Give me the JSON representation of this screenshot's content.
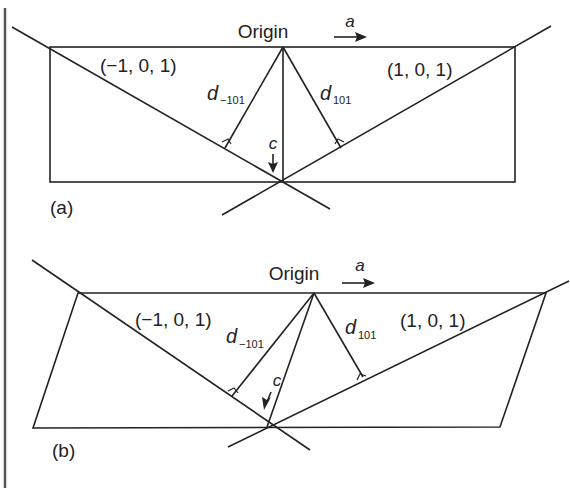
{
  "panels": [
    {
      "id": "a",
      "caption": "(a)",
      "origin_label": "Origin",
      "axis_a_label": "a",
      "axis_c_label": "c",
      "plane_left_label": "(−1, 0, 1)",
      "plane_right_label": "(1, 0, 1)",
      "d_left_main": "d",
      "d_left_sub": "−101",
      "d_right_main": "d",
      "d_right_sub": "101"
    },
    {
      "id": "b",
      "caption": "(b)",
      "origin_label": "Origin",
      "axis_a_label": "a",
      "axis_c_label": "c",
      "plane_left_label": "(−1, 0, 1)",
      "plane_right_label": "(1, 0, 1)",
      "d_left_main": "d",
      "d_left_sub": "−101",
      "d_right_main": "d",
      "d_right_sub": "101"
    }
  ],
  "colors": {
    "line": "#222222",
    "background": "#ffffff"
  }
}
